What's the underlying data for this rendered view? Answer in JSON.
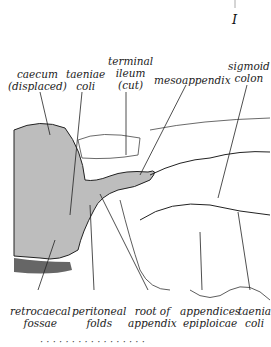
{
  "figure": {
    "marker": "I",
    "labels_top": [
      {
        "id": "caecum",
        "lines": [
          "caecum",
          "(displaced)"
        ]
      },
      {
        "id": "taeniae-coli",
        "lines": [
          "taeniae",
          "coli"
        ]
      },
      {
        "id": "terminal-ileum",
        "lines": [
          "terminal",
          "ileum",
          "(cut)"
        ]
      },
      {
        "id": "mesoappendix",
        "lines": [
          "mesoappendix"
        ]
      },
      {
        "id": "sigmoid-colon",
        "lines": [
          "sigmoid",
          "colon"
        ]
      }
    ],
    "labels_bottom": [
      {
        "id": "retrocaecal-fossae",
        "lines": [
          "retrocaecal",
          "fossae"
        ]
      },
      {
        "id": "peritoneal-folds",
        "lines": [
          "peritoneal",
          "folds"
        ]
      },
      {
        "id": "root-of-appendix",
        "lines": [
          "root of",
          "appendix"
        ]
      },
      {
        "id": "appendices-epiploicae",
        "lines": [
          "appendices",
          "epiploicae"
        ]
      },
      {
        "id": "taenia-coli",
        "lines": [
          "taenia",
          "coli"
        ]
      }
    ],
    "caption_cut": "· · · · · · · · · · · · · · · · ·",
    "colors": {
      "shade": "#bdbdbd",
      "line": "#222222"
    }
  }
}
